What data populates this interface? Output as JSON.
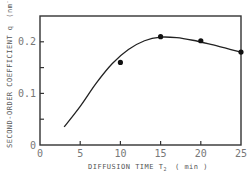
{
  "chart_data": {
    "type": "line",
    "title": "",
    "xlabel": "DIFFUSION TIME T2 ( min )",
    "ylabel": "SECOND-ORDER COEFFICIENT q (nm^-1)",
    "xlim": [
      0,
      25
    ],
    "ylim": [
      0,
      0.25
    ],
    "x_ticks": [
      0,
      5,
      10,
      15,
      20,
      25
    ],
    "x_tick_labels": [
      "0",
      "5",
      "10",
      "15",
      "20",
      "25"
    ],
    "y_ticks": [
      0,
      0.05,
      0.1,
      0.15,
      0.2
    ],
    "y_tick_labels": [
      "0",
      "",
      "0.1",
      "",
      "0.2"
    ],
    "grid": false,
    "legend": null,
    "series": [
      {
        "name": "measured",
        "style": "markers",
        "x": [
          10,
          15,
          20,
          25
        ],
        "y": [
          0.16,
          0.21,
          0.202,
          0.18
        ]
      },
      {
        "name": "fitted curve",
        "style": "line",
        "x": [
          3,
          5,
          7,
          9,
          11,
          13,
          15,
          17,
          19,
          21,
          23,
          25
        ],
        "y": [
          0.035,
          0.075,
          0.12,
          0.158,
          0.185,
          0.202,
          0.209,
          0.208,
          0.203,
          0.196,
          0.188,
          0.18
        ]
      }
    ]
  },
  "labels": {
    "ylabel_main": "SECOND-ORDER COEFFICIENT q",
    "ylabel_unit": "(nm",
    "ylabel_exp": "-1",
    "ylabel_close": ")",
    "xlabel_main": "DIFFUSION TIME T",
    "xlabel_sub": "2",
    "xlabel_unit": "( min )"
  }
}
